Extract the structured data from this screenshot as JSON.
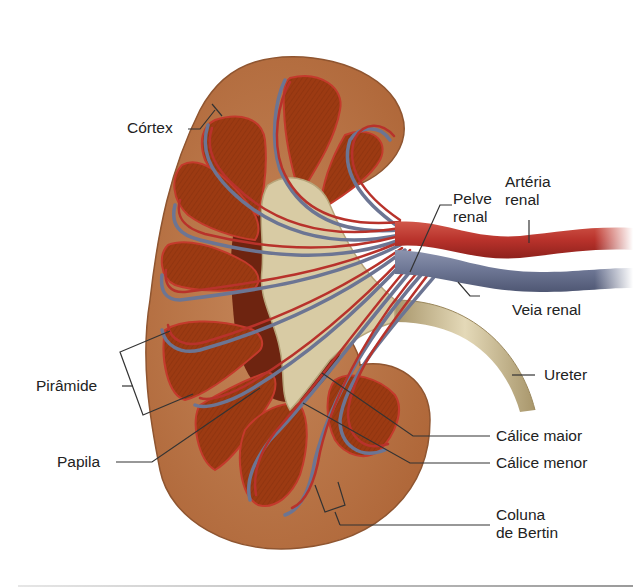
{
  "figure": {
    "colors": {
      "background": "#ffffff",
      "cortex": "#b8713f",
      "cortex_light": "#c98a55",
      "pyramid": "#9c3a12",
      "pyramid_dark": "#7a2a0c",
      "pelvis": "#d8cba4",
      "pelvis_shade": "#b7a57a",
      "artery": "#b8322b",
      "vein": "#6c7593",
      "label_text": "#222222",
      "leader_line": "#333333"
    }
  },
  "labels": {
    "cortex": {
      "text": "Córtex"
    },
    "renal_pelvis": {
      "line1": "Pelve",
      "line2": "renal"
    },
    "renal_artery": {
      "line1": "Artéria",
      "line2": "renal"
    },
    "renal_vein": {
      "text": "Veia renal"
    },
    "ureter": {
      "text": "Ureter"
    },
    "pyramid": {
      "text": "Pirâmide"
    },
    "papilla": {
      "text": "Papila"
    },
    "major_calyx": {
      "text": "Cálice maior"
    },
    "minor_calyx": {
      "text": "Cálice menor"
    },
    "column_of_bertin": {
      "line1": "Coluna",
      "line2": "de Bertin"
    }
  }
}
